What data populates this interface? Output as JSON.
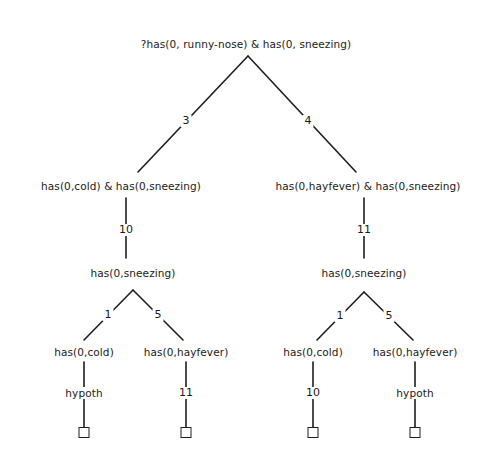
{
  "diagram": {
    "type": "proof-tree",
    "root": {
      "label": "?has(0, runny-nose) & has(0, sneezing)"
    },
    "level1": {
      "left": {
        "edge_label": "3",
        "label": "has(0,cold) & has(0,sneezing)",
        "down_edge_label": "10"
      },
      "right": {
        "edge_label": "4",
        "label": "has(0,hayfever) & has(0,sneezing)",
        "down_edge_label": "11"
      }
    },
    "level2": {
      "left": {
        "label": "has(0,sneezing)"
      },
      "right": {
        "label": "has(0,sneezing)"
      }
    },
    "level3": {
      "ll": {
        "edge_label": "1",
        "label": "has(0,cold)",
        "down_label": "hypoth"
      },
      "lr": {
        "edge_label": "5",
        "label": "has(0,hayfever)",
        "down_label": "11"
      },
      "rl": {
        "edge_label": "1",
        "label": "has(0,cold)",
        "down_label": "10"
      },
      "rr": {
        "edge_label": "5",
        "label": "has(0,hayfever)",
        "down_label": "hypoth"
      }
    },
    "leaves": [
      "empty-box",
      "empty-box",
      "empty-box",
      "empty-box"
    ]
  }
}
